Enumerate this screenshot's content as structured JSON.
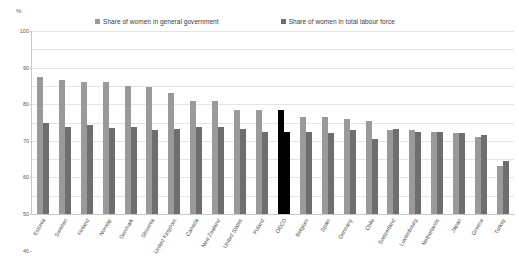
{
  "axis": {
    "unit_label": "%",
    "y_ticks": [
      0,
      10,
      20,
      30,
      40,
      50,
      60,
      70,
      80,
      90,
      100
    ]
  },
  "legend": {
    "entries": [
      {
        "label": "Share of women in general government",
        "color": "#9a9a9a",
        "name": "legend-general-government"
      },
      {
        "label": "Share of women in total labour force",
        "color": "#6e6e6e",
        "name": "legend-total-labour-force"
      }
    ]
  },
  "colors": {
    "series_general_government": "#9a9a9a",
    "series_total_labour_force": "#6e6e6e",
    "highlight": "#000000",
    "gridline": "#e4e4e4",
    "axis": "#c8c8c8"
  },
  "chart_data": {
    "type": "bar",
    "title": "",
    "subtitle": "",
    "xlabel": "",
    "ylabel": "%",
    "ylim": [
      0,
      100
    ],
    "grid": true,
    "legend_position": "top",
    "highlight_category": "OECD",
    "categories": [
      "Estonia",
      "Sweden",
      "Finland",
      "Norway",
      "Denmark",
      "Slovenia",
      "United Kingdom",
      "Canada",
      "New Zealand",
      "United States",
      "Poland",
      "OECD",
      "Belgium",
      "Spain",
      "Germany",
      "Chile",
      "Switzerland",
      "Luxembourg",
      "Netherlands",
      "Japan",
      "Greece",
      "Turkey"
    ],
    "series": [
      {
        "name": "Share of women in general government",
        "values": [
          75,
          73,
          72,
          72,
          70,
          69.5,
          66,
          62,
          62,
          57,
          57,
          57,
          53,
          53,
          52,
          51,
          46,
          46,
          45,
          44,
          42,
          26
        ]
      },
      {
        "name": "Share of women in total labour force",
        "values": [
          50,
          47.5,
          48.5,
          47,
          47.5,
          46,
          46.5,
          47.5,
          47.5,
          46.5,
          45,
          45,
          45,
          44.5,
          46,
          41,
          46.5,
          45,
          45,
          44,
          43,
          29
        ]
      }
    ]
  }
}
